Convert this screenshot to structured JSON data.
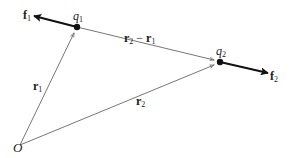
{
  "diagram": {
    "type": "vector diagram of two point charges",
    "points": {
      "origin": {
        "label": "O",
        "x": 20,
        "y": 145
      },
      "q1": {
        "label": "q",
        "sub": "1",
        "x": 77,
        "y": 27
      },
      "q2": {
        "label": "q",
        "sub": "2",
        "x": 220,
        "y": 62
      }
    },
    "vectors": {
      "r1": {
        "label": "r",
        "sub": "1",
        "from": "origin",
        "to": "q1"
      },
      "r2": {
        "label": "r",
        "sub": "2",
        "from": "origin",
        "to": "q2"
      },
      "r2_minus_r1": {
        "label_a": "r",
        "sub_a": "2",
        "op": " − ",
        "label_b": "r",
        "sub_b": "1",
        "from": "q1",
        "to": "q2"
      },
      "f1": {
        "label": "f",
        "sub": "1",
        "from": "q1",
        "to_x": 34,
        "to_y": 16
      },
      "f2": {
        "label": "f",
        "sub": "2",
        "from": "q2",
        "to_x": 268,
        "to_y": 73
      }
    },
    "colors": {
      "line": "#555555",
      "force": "#111111",
      "text": "#222222"
    }
  }
}
